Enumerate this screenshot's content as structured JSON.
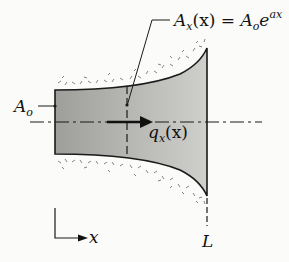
{
  "diagram": {
    "type": "tapered-bar-flux",
    "labels": {
      "area_formula_lhs": "A",
      "area_formula_lhs_sub": "x",
      "area_formula_lhs_arg": "(x)",
      "area_formula_eq": " = ",
      "area_formula_rhs_base": "A",
      "area_formula_rhs_sub": "o",
      "area_formula_rhs_e": "e",
      "area_formula_rhs_exp": "ax",
      "inlet_area": "A",
      "inlet_area_sub": "o",
      "flux": "q",
      "flux_sub": "x",
      "flux_arg": "(x)",
      "axis": "x",
      "length": "L"
    },
    "colors": {
      "body_fill": "#b9b9b5",
      "outline": "#1a1a1a",
      "insulation_dots": "#555555",
      "background": "#fbfbf9"
    }
  }
}
